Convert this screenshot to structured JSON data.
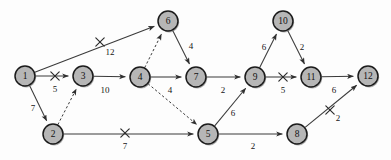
{
  "diagram": {
    "type": "network-graph",
    "width": 391,
    "height": 160,
    "background_color": "#fdfdfd",
    "node_fill_color": "#b6b6b6",
    "node_border_color": "#1b1b1b",
    "edge_color": "#3a3a3a",
    "nodes": [
      {
        "id": "1",
        "label": "1",
        "cx": 25,
        "cy": 76,
        "r": 10
      },
      {
        "id": "2",
        "label": "2",
        "cx": 53,
        "cy": 134,
        "r": 10
      },
      {
        "id": "3",
        "label": "3",
        "cx": 83,
        "cy": 76,
        "r": 10
      },
      {
        "id": "4",
        "label": "4",
        "cx": 140,
        "cy": 77,
        "r": 10
      },
      {
        "id": "5",
        "label": "5",
        "cx": 208,
        "cy": 134,
        "r": 10
      },
      {
        "id": "6",
        "label": "6",
        "cx": 168,
        "cy": 21,
        "r": 10
      },
      {
        "id": "7",
        "label": "7",
        "cx": 196,
        "cy": 77,
        "r": 10
      },
      {
        "id": "8",
        "label": "8",
        "cx": 297,
        "cy": 134,
        "r": 10
      },
      {
        "id": "9",
        "label": "9",
        "cx": 255,
        "cy": 77,
        "r": 10
      },
      {
        "id": "10",
        "label": "10",
        "cx": 283,
        "cy": 21,
        "r": 10
      },
      {
        "id": "11",
        "label": "11",
        "cx": 311,
        "cy": 77,
        "r": 10
      },
      {
        "id": "12",
        "label": "12",
        "cx": 368,
        "cy": 76,
        "r": 10
      }
    ],
    "edges": [
      {
        "from": "1",
        "to": "6",
        "weight": "12",
        "style": "solid",
        "crossed": true,
        "label_x": 110,
        "label_y": 52,
        "cross_x": 100,
        "cross_y": 42
      },
      {
        "from": "1",
        "to": "3",
        "weight": "5",
        "style": "solid",
        "crossed": true,
        "label_x": 55,
        "label_y": 89,
        "cross_x": 55,
        "cross_y": 76
      },
      {
        "from": "1",
        "to": "2",
        "weight": "7",
        "style": "solid",
        "crossed": false,
        "label_x": 33,
        "label_y": 108,
        "cross_x": 0,
        "cross_y": 0
      },
      {
        "from": "2",
        "to": "3",
        "weight": "",
        "style": "dashed",
        "crossed": false,
        "label_x": 0,
        "label_y": 0,
        "cross_x": 0,
        "cross_y": 0
      },
      {
        "from": "2",
        "to": "5",
        "weight": "7",
        "style": "solid",
        "crossed": true,
        "label_x": 125,
        "label_y": 146,
        "cross_x": 125,
        "cross_y": 133
      },
      {
        "from": "3",
        "to": "4",
        "weight": "10",
        "style": "solid",
        "crossed": false,
        "label_x": 105,
        "label_y": 90,
        "cross_x": 0,
        "cross_y": 0
      },
      {
        "from": "4",
        "to": "6",
        "weight": "",
        "style": "dashed",
        "crossed": false,
        "label_x": 0,
        "label_y": 0,
        "cross_x": 0,
        "cross_y": 0
      },
      {
        "from": "4",
        "to": "7",
        "weight": "4",
        "style": "solid",
        "crossed": false,
        "label_x": 170,
        "label_y": 90,
        "cross_x": 0,
        "cross_y": 0
      },
      {
        "from": "4",
        "to": "5",
        "weight": "",
        "style": "dashed",
        "crossed": false,
        "label_x": 0,
        "label_y": 0,
        "cross_x": 0,
        "cross_y": 0
      },
      {
        "from": "6",
        "to": "7",
        "weight": "4",
        "style": "solid",
        "crossed": false,
        "label_x": 191,
        "label_y": 46,
        "cross_x": 0,
        "cross_y": 0
      },
      {
        "from": "7",
        "to": "9",
        "weight": "2",
        "style": "solid",
        "crossed": false,
        "label_x": 223,
        "label_y": 90,
        "cross_x": 0,
        "cross_y": 0
      },
      {
        "from": "5",
        "to": "9",
        "weight": "6",
        "style": "solid",
        "crossed": false,
        "label_x": 233,
        "label_y": 113,
        "cross_x": 0,
        "cross_y": 0
      },
      {
        "from": "5",
        "to": "8",
        "weight": "2",
        "style": "solid",
        "crossed": false,
        "label_x": 253,
        "label_y": 146,
        "cross_x": 0,
        "cross_y": 0
      },
      {
        "from": "9",
        "to": "10",
        "weight": "6",
        "style": "solid",
        "crossed": false,
        "label_x": 264,
        "label_y": 47,
        "cross_x": 0,
        "cross_y": 0
      },
      {
        "from": "9",
        "to": "11",
        "weight": "5",
        "style": "solid",
        "crossed": true,
        "label_x": 283,
        "label_y": 90,
        "cross_x": 283,
        "cross_y": 77
      },
      {
        "from": "10",
        "to": "11",
        "weight": "2",
        "style": "solid",
        "crossed": false,
        "label_x": 302,
        "label_y": 47,
        "cross_x": 0,
        "cross_y": 0
      },
      {
        "from": "11",
        "to": "12",
        "weight": "6",
        "style": "solid",
        "crossed": false,
        "label_x": 334,
        "label_y": 90,
        "cross_x": 0,
        "cross_y": 0
      },
      {
        "from": "8",
        "to": "12",
        "weight": "2",
        "style": "solid",
        "crossed": true,
        "label_x": 338,
        "label_y": 118,
        "cross_x": 330,
        "cross_y": 110
      }
    ]
  }
}
